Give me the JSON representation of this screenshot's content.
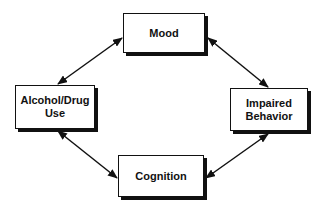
{
  "diagram": {
    "type": "cycle",
    "colors": {
      "stroke": "#111111",
      "background": "#ffffff"
    },
    "nodes": [
      {
        "id": "mood",
        "label": "Mood"
      },
      {
        "id": "alcohol",
        "label_line1": "Alcohol/Drug",
        "label_line2": "Use"
      },
      {
        "id": "impaired",
        "label_line1": "Impaired",
        "label_line2": "Behavior"
      },
      {
        "id": "cognition",
        "label": "Cognition"
      }
    ],
    "edges": [
      {
        "from": "alcohol",
        "to": "mood",
        "direction": "bidirectional"
      },
      {
        "from": "mood",
        "to": "impaired",
        "direction": "bidirectional"
      },
      {
        "from": "impaired",
        "to": "cognition",
        "direction": "bidirectional"
      },
      {
        "from": "cognition",
        "to": "alcohol",
        "direction": "bidirectional"
      }
    ]
  }
}
